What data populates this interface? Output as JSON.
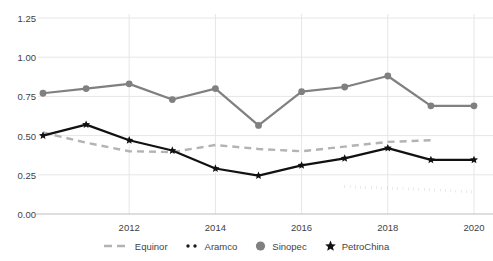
{
  "chart_data": {
    "type": "line",
    "title": "",
    "xlabel": "",
    "ylabel": "",
    "x": [
      2010,
      2011,
      2012,
      2013,
      2014,
      2015,
      2016,
      2017,
      2018,
      2019,
      2020
    ],
    "xlim": [
      2010,
      2020
    ],
    "ylim": [
      0.0,
      1.25
    ],
    "xticks": [
      "2012",
      "2014",
      "2016",
      "2018",
      "2020"
    ],
    "xtick_values": [
      2012,
      2014,
      2016,
      2018,
      2020
    ],
    "yticks": [
      "0.00",
      "0.25",
      "0.50",
      "0.75",
      "1.00",
      "1.25"
    ],
    "ytick_values": [
      0.0,
      0.25,
      0.5,
      0.75,
      1.0,
      1.25
    ],
    "grid": true,
    "legend_position": "bottom",
    "series": [
      {
        "name": "Equinor",
        "style": "dashed",
        "color": "#b3b3b3",
        "marker": "none",
        "x": [
          2010,
          2011,
          2012,
          2013,
          2014,
          2015,
          2016,
          2017,
          2018,
          2019
        ],
        "values": [
          0.52,
          0.455,
          0.4,
          0.395,
          0.44,
          0.415,
          0.4,
          0.43,
          0.46,
          0.47
        ]
      },
      {
        "name": "Aramco",
        "style": "dotted",
        "color": "#1a1a1a",
        "marker": "none",
        "x": [
          2017,
          2018,
          2019,
          2020
        ],
        "values": [
          0.175,
          0.165,
          0.155,
          0.14
        ]
      },
      {
        "name": "Sinopec",
        "style": "solid",
        "color": "#808080",
        "marker": "circle",
        "x": [
          2010,
          2011,
          2012,
          2013,
          2014,
          2015,
          2016,
          2017,
          2018,
          2019,
          2020
        ],
        "values": [
          0.77,
          0.8,
          0.83,
          0.73,
          0.8,
          0.565,
          0.78,
          0.81,
          0.88,
          0.69,
          0.69
        ]
      },
      {
        "name": "PetroChina",
        "style": "solid",
        "color": "#111111",
        "marker": "star",
        "x": [
          2010,
          2011,
          2012,
          2013,
          2014,
          2015,
          2016,
          2017,
          2018,
          2019,
          2020
        ],
        "values": [
          0.5,
          0.57,
          0.47,
          0.405,
          0.29,
          0.245,
          0.31,
          0.355,
          0.42,
          0.345,
          0.345
        ]
      }
    ]
  },
  "legend": {
    "items": [
      {
        "label": "Equinor",
        "kind": "dashed-line",
        "color": "#b3b3b3"
      },
      {
        "label": "Aramco",
        "kind": "dotted-line",
        "color": "#1a1a1a"
      },
      {
        "label": "Sinopec",
        "kind": "circle-marker",
        "color": "#808080"
      },
      {
        "label": "PetroChina",
        "kind": "star-marker",
        "color": "#111111"
      }
    ]
  },
  "colors": {
    "grid": "#e6e6e6",
    "axis": "#bdbdbd",
    "text": "#3f3f3f",
    "background": "#ffffff"
  }
}
